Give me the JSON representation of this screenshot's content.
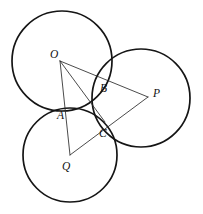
{
  "figure": {
    "width": 203,
    "height": 214,
    "background_color": "#ffffff",
    "stroke_color": "#151515",
    "line_color": "#2a2a2a"
  },
  "circles": [
    {
      "name": "circle-O",
      "center_label": "O",
      "cx": 62,
      "cy": 61,
      "r": 50
    },
    {
      "name": "circle-P",
      "center_label": "P",
      "cx": 141,
      "cy": 98,
      "r": 49
    },
    {
      "name": "circle-Q",
      "center_label": "Q",
      "cx": 70,
      "cy": 155,
      "r": 47
    }
  ],
  "centers": [
    {
      "label": "O",
      "x": 60,
      "y": 61,
      "label_x": 50,
      "label_y": 58
    },
    {
      "label": "P",
      "x": 148,
      "y": 97,
      "label_x": 153,
      "label_y": 97
    },
    {
      "label": "Q",
      "x": 70,
      "y": 155,
      "label_x": 62,
      "label_y": 170
    }
  ],
  "tangent_points": [
    {
      "label": "A",
      "x": 67,
      "y": 108,
      "label_x": 57,
      "label_y": 119,
      "between": "O-Q"
    },
    {
      "label": "B",
      "x": 103,
      "y": 80,
      "label_x": 100,
      "label_y": 92,
      "between": "O-P"
    },
    {
      "label": "C",
      "x": 105,
      "y": 122,
      "label_x": 99,
      "label_y": 137,
      "between": "P-Q"
    }
  ],
  "segments": [
    {
      "name": "segment-OP",
      "from": "O",
      "to": "P",
      "x1": 60,
      "y1": 61,
      "x2": 148,
      "y2": 97
    },
    {
      "name": "segment-OQ",
      "from": "O",
      "to": "Q",
      "x1": 60,
      "y1": 61,
      "x2": 70,
      "y2": 155
    },
    {
      "name": "segment-OC",
      "from": "O",
      "to": "C",
      "x1": 60,
      "y1": 61,
      "x2": 105,
      "y2": 122
    },
    {
      "name": "segment-QP",
      "from": "Q",
      "to": "P",
      "x1": 70,
      "y1": 155,
      "x2": 148,
      "y2": 97
    }
  ],
  "labels": {
    "O": "O",
    "P": "P",
    "Q": "Q",
    "A": "A",
    "B": "B",
    "C": "C"
  }
}
